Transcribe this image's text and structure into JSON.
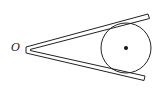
{
  "diagram": {
    "vertex_label": "O",
    "colors": {
      "stroke": "#222222",
      "background": "#ffffff",
      "center_dot": "#111111"
    },
    "geometry": {
      "vertex": [
        26,
        50
      ],
      "upper_arm_end": [
        149,
        16
      ],
      "lower_arm_end": [
        145,
        78
      ],
      "circle_center": [
        126,
        48
      ],
      "circle_radius": 25
    }
  }
}
